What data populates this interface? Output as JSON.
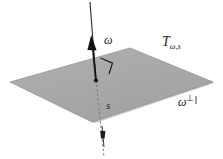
{
  "figure": {
    "background_color": "#ffffff",
    "width": 223,
    "height": 159
  },
  "plane": {
    "name": "T",
    "label_base": "T",
    "label_subscript": "ω,s",
    "fill_color": "#a9a9a9",
    "edge_color": "#8a8a8a",
    "vertices": [
      {
        "x": 10,
        "y": 82
      },
      {
        "x": 130,
        "y": 48
      },
      {
        "x": 213,
        "y": 82
      },
      {
        "x": 92,
        "y": 122
      }
    ]
  },
  "axis": {
    "label": "ω",
    "line_color": "#1c1c1c",
    "top_point": {
      "x": 90,
      "y": 2
    },
    "pierce_point": {
      "x": 96,
      "y": 80
    },
    "bottom_point": {
      "x": 104,
      "y": 157
    },
    "arrow_tip": {
      "x": 92,
      "y": 36
    },
    "arrow_color": "#111111"
  },
  "line_s": {
    "label": "s",
    "style": "dashed",
    "color": "#6f6f6f",
    "marker_point": {
      "x": 103,
      "y": 135
    }
  },
  "perp_direction": {
    "label_base": "ω",
    "label_superscript": "⊥"
  },
  "right_angle_marker": {
    "name": "right-angle-marker",
    "color": "#1c1c1c",
    "size": 11
  }
}
